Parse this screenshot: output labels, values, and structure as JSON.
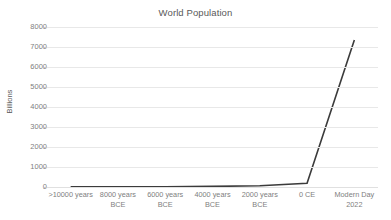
{
  "chart_data": {
    "type": "line",
    "title": "World Population",
    "xlabel": "",
    "ylabel": "Billions",
    "categories": [
      ">10000 years",
      "8000 years BCE",
      "6000 years BCE",
      "4000 years BCE",
      "2000 years BCE",
      "0 CE",
      "Modern Day 2022"
    ],
    "category_lines": [
      [
        ">10000 years",
        ""
      ],
      [
        "8000 years",
        "BCE"
      ],
      [
        "6000 years",
        "BCE"
      ],
      [
        "4000 years",
        "BCE"
      ],
      [
        "2000 years",
        "BCE"
      ],
      [
        "0 CE",
        ""
      ],
      [
        "Modern Day",
        "2022"
      ]
    ],
    "values": [
      5,
      10,
      15,
      30,
      60,
      190,
      7350
    ],
    "ylim": [
      0,
      8000
    ],
    "ytick_labels": [
      "8000",
      "7000",
      "6000",
      "5000",
      "4000",
      "3000",
      "2000",
      "1000",
      "0"
    ],
    "ytick_values": [
      8000,
      7000,
      6000,
      5000,
      4000,
      3000,
      2000,
      1000,
      0
    ],
    "grid": "horizontal",
    "legend": "none",
    "series": [
      {
        "name": "World Population",
        "values": [
          5,
          10,
          15,
          30,
          60,
          190,
          7350
        ],
        "color": "#3b3b3b"
      }
    ]
  },
  "colors": {
    "line": "#3b3b3b",
    "grid": "#e8e8e8",
    "text": "#808080",
    "title_text": "#595959",
    "background": "#ffffff"
  }
}
